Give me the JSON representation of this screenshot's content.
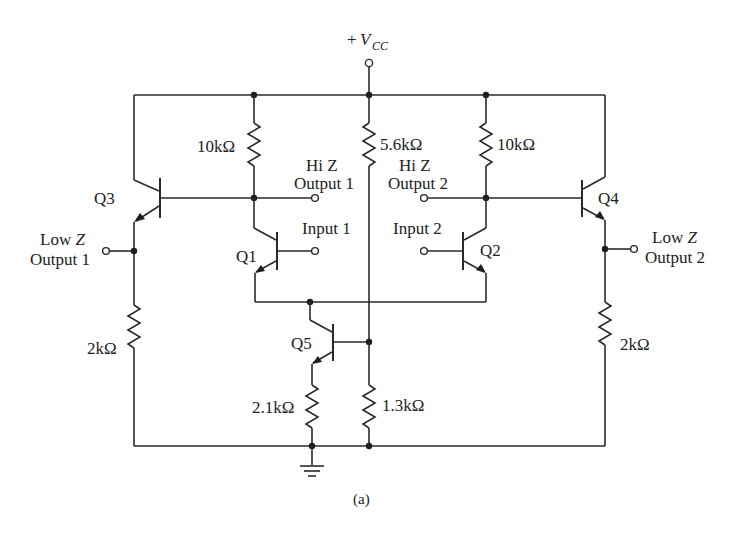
{
  "figure": {
    "caption": "(a)",
    "supply": {
      "prefix": "+",
      "symbol": "V",
      "subscript": "CC"
    }
  },
  "transistors": [
    {
      "id": "Q1",
      "label": "Q1",
      "type": "NPN"
    },
    {
      "id": "Q2",
      "label": "Q2",
      "type": "NPN"
    },
    {
      "id": "Q3",
      "label": "Q3",
      "type": "NPN"
    },
    {
      "id": "Q4",
      "label": "Q4",
      "type": "NPN"
    },
    {
      "id": "Q5",
      "label": "Q5",
      "type": "NPN"
    }
  ],
  "resistors": [
    {
      "id": "R_Q1_collector",
      "value": "10kΩ"
    },
    {
      "id": "R_bias_top",
      "value": "5.6kΩ"
    },
    {
      "id": "R_Q2_collector",
      "value": "10kΩ"
    },
    {
      "id": "R_Q3_emitter",
      "value": "2kΩ"
    },
    {
      "id": "R_Q4_emitter",
      "value": "2kΩ"
    },
    {
      "id": "R_Q5_emitter",
      "value": "2.1kΩ"
    },
    {
      "id": "R_bias_bottom",
      "value": "1.3kΩ"
    }
  ],
  "terminals": {
    "hi_z_output_1": {
      "line1": "Hi Z",
      "line2": "Output 1"
    },
    "hi_z_output_2": {
      "line1": "Hi Z",
      "line2": "Output 2"
    },
    "input_1": {
      "label": "Input 1"
    },
    "input_2": {
      "label": "Input 2"
    },
    "low_z_output_1": {
      "line1_plain": "Low ",
      "line1_italic": "Z",
      "line2": "Output 1"
    },
    "low_z_output_2": {
      "line1_plain": "Low ",
      "line1_italic": "Z",
      "line2": "Output 2"
    }
  },
  "colors": {
    "ink": "#222222",
    "background": "#ffffff"
  }
}
